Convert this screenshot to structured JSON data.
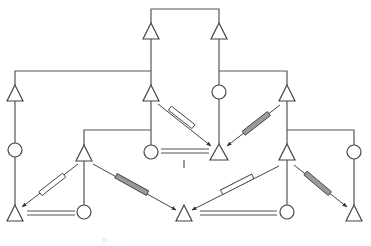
{
  "diagram": {
    "type": "pedigree-style network diagram",
    "colors": {
      "line": "#555555",
      "symbol_stroke": "#444444",
      "symbol_fill": "#ffffff",
      "hatched_fill": "#9a9a9a",
      "open_fill": "#ffffff"
    },
    "legend": {
      "triangle": "triangle-node",
      "circle": "circle-node",
      "double-line": "double-bar-link",
      "open-bar-arrow": "open-connector-arrow",
      "filled-bar-arrow": "filled-connector-arrow"
    },
    "nodes": [
      {
        "id": "t1",
        "shape": "triangle",
        "x": 151,
        "y": 31
      },
      {
        "id": "t2",
        "shape": "triangle",
        "x": 219,
        "y": 31
      },
      {
        "id": "t3",
        "shape": "triangle",
        "x": 15,
        "y": 93
      },
      {
        "id": "t4",
        "shape": "triangle",
        "x": 151,
        "y": 93
      },
      {
        "id": "c1",
        "shape": "circle",
        "x": 219,
        "y": 92
      },
      {
        "id": "t5",
        "shape": "triangle",
        "x": 287,
        "y": 93
      },
      {
        "id": "c2",
        "shape": "circle",
        "x": 15,
        "y": 150
      },
      {
        "id": "t6",
        "shape": "triangle",
        "x": 84,
        "y": 153
      },
      {
        "id": "c3",
        "shape": "circle",
        "x": 151,
        "y": 152
      },
      {
        "id": "t7",
        "shape": "triangle",
        "x": 219,
        "y": 152
      },
      {
        "id": "t8",
        "shape": "triangle",
        "x": 287,
        "y": 152
      },
      {
        "id": "c4",
        "shape": "circle",
        "x": 354,
        "y": 152
      },
      {
        "id": "t9",
        "shape": "triangle",
        "x": 15,
        "y": 213
      },
      {
        "id": "c5",
        "shape": "circle",
        "x": 84,
        "y": 212
      },
      {
        "id": "t10",
        "shape": "triangle",
        "x": 184,
        "y": 213
      },
      {
        "id": "c6",
        "shape": "circle",
        "x": 287,
        "y": 212
      },
      {
        "id": "t11",
        "shape": "triangle",
        "x": 354,
        "y": 213
      }
    ],
    "caption": "· · · ·  ◘ ·  · · · ·  · · · · ·"
  }
}
